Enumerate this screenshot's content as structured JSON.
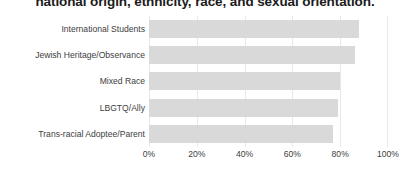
{
  "chart_data": {
    "type": "bar",
    "orientation": "horizontal",
    "title": "national origin, ethnicity, race, and sexual orientation.",
    "xlabel": "",
    "ylabel": "",
    "xlim": [
      0,
      100
    ],
    "xticks": [
      0,
      20,
      40,
      60,
      80,
      100
    ],
    "xtick_labels": [
      "0%",
      "20%",
      "40%",
      "60%",
      "80%",
      "100%"
    ],
    "grid": true,
    "grid_axis": "x",
    "legend": false,
    "bar_color": "#d9d9d9",
    "categories": [
      "International Students",
      "Jewish Heritage/Observance",
      "Mixed Race",
      "LBGTQ/Ally",
      "Trans-racial Adoptee/Parent"
    ],
    "values": [
      88,
      86,
      80,
      79,
      77
    ],
    "value_labels": [
      "88%",
      "86%",
      "80%",
      "79%",
      "77%"
    ]
  },
  "axis": {
    "tick_0": "0%",
    "tick_1": "20%",
    "tick_2": "40%",
    "tick_3": "60%",
    "tick_4": "80%",
    "tick_5": "100%"
  }
}
